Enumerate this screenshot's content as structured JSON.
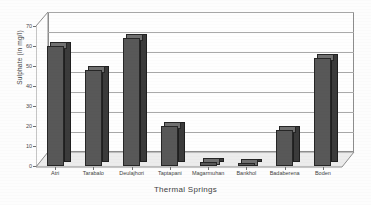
{
  "chart_data": {
    "type": "bar",
    "title": "",
    "xlabel": "Thermal Springs",
    "ylabel": "Sulphate (in mg/l)",
    "categories": [
      "Atri",
      "Tarabalo",
      "Deulajhori",
      "Taptapani",
      "Magarmuhan",
      "Bankhol",
      "Badaberena",
      "Boden"
    ],
    "values": [
      60,
      48,
      64,
      20,
      2,
      1.5,
      18,
      54
    ],
    "ylim": [
      0,
      70
    ],
    "yticks": [
      0,
      10,
      20,
      30,
      40,
      50,
      60,
      70
    ],
    "ytick_labels": [
      "0",
      "10",
      "20",
      "30",
      "40",
      "50",
      "60",
      "70"
    ],
    "grid": true,
    "legend": "none",
    "style": "3d-column",
    "series_name": "Sulphate"
  },
  "colors": {
    "bar_front": "#585858",
    "bar_side": "#3b3b3b",
    "bar_top": "#707070",
    "gridline": "#a9a9a9",
    "axis": "#8d8d8d",
    "text": "#3f3f3f",
    "plot_background": "#fefefe",
    "floor": "#eeeeee"
  }
}
